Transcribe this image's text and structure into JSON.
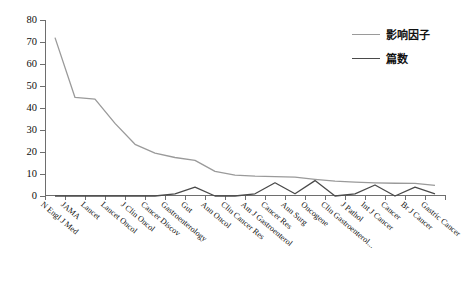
{
  "chart_data": {
    "type": "line",
    "title": "",
    "xlabel": "",
    "ylabel": "",
    "ylim": [
      0,
      80
    ],
    "yticks": [
      0,
      10,
      20,
      30,
      40,
      50,
      60,
      70,
      80
    ],
    "grid": false,
    "legend_position": "top-right",
    "categories": [
      "N Engl J Med",
      "JAMA",
      "Lancet",
      "Lancet Oncol",
      "J Clin Oncol",
      "Cancer Discov",
      "Gastroenterology",
      "Gut",
      "Ann Oncol",
      "Clin Cancer Res",
      "Am J Gastroenterol",
      "Cancer Res",
      "Ann Surg",
      "Oncogene",
      "Clin Gastroenterol...",
      "J Pathol",
      "Int J Cancer",
      "Cancer",
      "Br J Cancer",
      "Gastric Cancer"
    ],
    "series": [
      {
        "name": "影响因子",
        "color": "#9a9a9a",
        "values": [
          72,
          44.8,
          44,
          33,
          23.5,
          19.5,
          17.5,
          16.2,
          11.2,
          9.5,
          9.0,
          8.8,
          8.6,
          7.6,
          6.8,
          6.3,
          6.0,
          5.8,
          5.7,
          4.8
        ]
      },
      {
        "name": "篇数",
        "color": "#4a4a4a",
        "values": [
          0,
          0,
          0,
          0,
          0,
          0,
          1,
          4,
          0,
          0,
          1,
          6,
          1,
          7,
          0,
          1,
          5,
          0,
          4,
          1
        ]
      }
    ]
  },
  "legend": {
    "entries": [
      {
        "label": "影响因子",
        "color": "#9a9a9a"
      },
      {
        "label": "篇数",
        "color": "#4a4a4a"
      }
    ]
  },
  "axes": {
    "y_tick_labels": [
      "0",
      "10",
      "20",
      "30",
      "40",
      "50",
      "60",
      "70",
      "80"
    ],
    "axis_color": "#6e6e6e"
  }
}
